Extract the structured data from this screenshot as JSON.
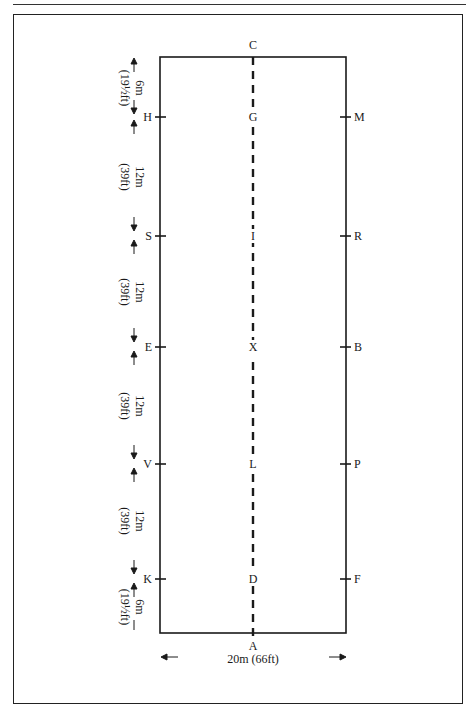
{
  "diagram": {
    "type": "dressage-arena",
    "markers": {
      "top": "C",
      "bottom": "A",
      "left": [
        "H",
        "S",
        "E",
        "V",
        "K"
      ],
      "right": [
        "M",
        "R",
        "B",
        "P",
        "F"
      ],
      "centerline": [
        "G",
        "I",
        "X",
        "L",
        "D"
      ]
    },
    "side_dimensions": [
      {
        "metric": "6m",
        "imperial": "(19½ft)"
      },
      {
        "metric": "12m",
        "imperial": "(39ft)"
      },
      {
        "metric": "12m",
        "imperial": "(39ft)"
      },
      {
        "metric": "12m",
        "imperial": "(39ft)"
      },
      {
        "metric": "12m",
        "imperial": "(39ft)"
      },
      {
        "metric": "6m",
        "imperial": "(19½ft)"
      }
    ],
    "width_dimension": "20m (66ft)",
    "colors": {
      "line": "#1a1a1a",
      "background": "#ffffff"
    }
  }
}
